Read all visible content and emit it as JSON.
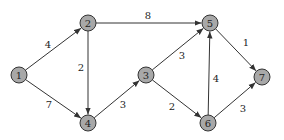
{
  "diagram": {
    "type": "directed-weighted-graph",
    "node_fill": "#a8a8a8",
    "node_stroke": "#333333",
    "edge_color": "#333333",
    "nodes": [
      {
        "id": "1",
        "label": "1",
        "x": 19,
        "y": 75
      },
      {
        "id": "2",
        "label": "2",
        "x": 88,
        "y": 23
      },
      {
        "id": "3",
        "label": "3",
        "x": 146,
        "y": 75
      },
      {
        "id": "4",
        "label": "4",
        "x": 88,
        "y": 123
      },
      {
        "id": "5",
        "label": "5",
        "x": 210,
        "y": 23
      },
      {
        "id": "6",
        "label": "6",
        "x": 208,
        "y": 123
      },
      {
        "id": "7",
        "label": "7",
        "x": 262,
        "y": 77
      }
    ],
    "edges": [
      {
        "from": "1",
        "to": "2",
        "weight": "4",
        "lx": 48,
        "ly": 48
      },
      {
        "from": "1",
        "to": "4",
        "weight": "7",
        "lx": 49,
        "ly": 108
      },
      {
        "from": "2",
        "to": "5",
        "weight": "8",
        "lx": 148,
        "ly": 19
      },
      {
        "from": "2",
        "to": "4",
        "weight": "2",
        "lx": 81,
        "ly": 71
      },
      {
        "from": "4",
        "to": "3",
        "weight": "3",
        "lx": 123,
        "ly": 108
      },
      {
        "from": "3",
        "to": "5",
        "weight": "3",
        "lx": 182,
        "ly": 59
      },
      {
        "from": "3",
        "to": "6",
        "weight": "2",
        "lx": 172,
        "ly": 110
      },
      {
        "from": "6",
        "to": "5",
        "weight": "4",
        "lx": 216,
        "ly": 82
      },
      {
        "from": "5",
        "to": "7",
        "weight": "1",
        "lx": 246,
        "ly": 46
      },
      {
        "from": "6",
        "to": "7",
        "weight": "3",
        "lx": 243,
        "ly": 112
      }
    ]
  }
}
